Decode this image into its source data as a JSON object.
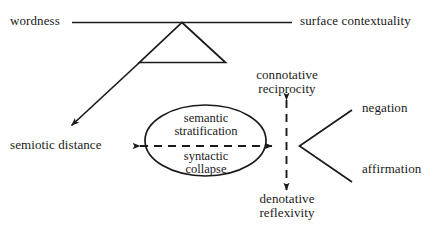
{
  "diagram": {
    "background_color": "#ffffff",
    "stroke_color": "#1a1a1a",
    "text_color": "#1a1a1a",
    "labels": {
      "wordness": "wordness",
      "surface_contextuality": "surface contextuality",
      "semiotic_distance": "semiotic distance",
      "connotative_line1": "connotative",
      "connotative_line2": "reciprocity",
      "denotative_line1": "denotative",
      "denotative_line2": "reflexivity",
      "negation": "negation",
      "affirmation": "affirmation",
      "ellipse_top_line1": "semantic",
      "ellipse_top_line2": "stratification",
      "ellipse_bottom_line1": "syntactic",
      "ellipse_bottom_line2": "collapse"
    },
    "shapes": {
      "triangle": "triangle",
      "ellipse": "ellipse",
      "horizontal_connector": "solid-line",
      "diagonal_arrow": "arrow-down-left",
      "horizontal_dashed_arrow": "dashed-double-arrow",
      "vertical_dashed_arrow": "dashed-double-arrow",
      "v_connector": "angle-bracket"
    }
  }
}
